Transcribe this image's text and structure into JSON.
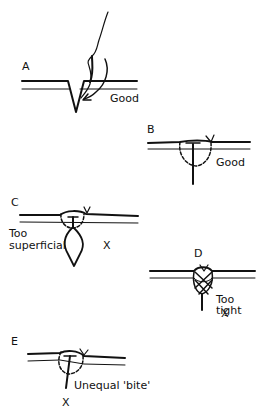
{
  "figure": {
    "type": "suture-technique-diagram",
    "panels": [
      {
        "id": "A",
        "letter": "A",
        "caption": "Good",
        "verdict": ""
      },
      {
        "id": "B",
        "letter": "B",
        "caption": "Good",
        "verdict": ""
      },
      {
        "id": "C",
        "letter": "C",
        "caption": "Too\nsuperficial",
        "caption_line1": "Too",
        "caption_line2": "superficial",
        "verdict": "X"
      },
      {
        "id": "D",
        "letter": "D",
        "caption": "Too tight",
        "verdict": "X"
      },
      {
        "id": "E",
        "letter": "E",
        "caption": "Unequal 'bite'",
        "verdict": "X"
      }
    ]
  }
}
